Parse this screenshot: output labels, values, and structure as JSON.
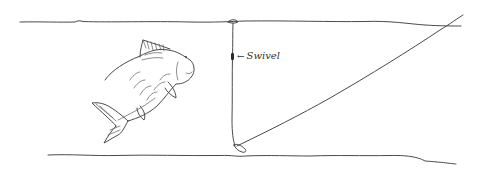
{
  "diagram": {
    "labels": {
      "swivel_arrow": "←",
      "swivel": "Swivel"
    },
    "elements": [
      {
        "name": "water-surface-line",
        "type": "line"
      },
      {
        "name": "lake-bottom-line",
        "type": "line"
      },
      {
        "name": "carp-fish",
        "type": "drawing"
      },
      {
        "name": "float",
        "type": "drawing"
      },
      {
        "name": "vertical-line",
        "type": "line"
      },
      {
        "name": "swivel",
        "type": "drawing"
      },
      {
        "name": "lead-weight",
        "type": "drawing"
      },
      {
        "name": "main-line-to-rod",
        "type": "line"
      }
    ],
    "colors": {
      "ink": "#4a4a4a",
      "background": "#ffffff"
    }
  }
}
